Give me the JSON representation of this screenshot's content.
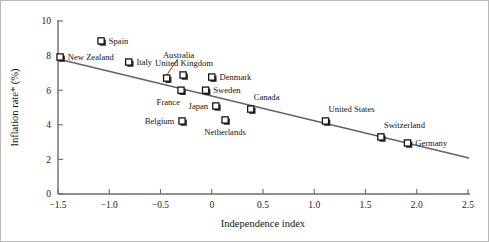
{
  "chart_data": {
    "type": "scatter",
    "title": "",
    "xlabel": "Independence index",
    "ylabel": "Inflation rate* (%)",
    "xlim": [
      -1.5,
      2.5
    ],
    "ylim": [
      0,
      10
    ],
    "grid": false,
    "legend": "none",
    "xticks": [
      "−1.5",
      "−1.0",
      "−0.5",
      "0",
      "0.5",
      "1.0",
      "1.5",
      "2.0",
      "2.5"
    ],
    "xtick_values": [
      -1.5,
      -1.0,
      -0.5,
      0,
      0.5,
      1.0,
      1.5,
      2.0,
      2.5
    ],
    "yticks": [
      "0",
      "2",
      "4",
      "6",
      "8",
      "10"
    ],
    "ytick_values": [
      0,
      2,
      4,
      6,
      8,
      10
    ],
    "points": [
      {
        "label": "New Zealand",
        "x": -1.48,
        "y": 7.92,
        "label_pos": "right"
      },
      {
        "label": "Spain",
        "x": -1.08,
        "y": 8.85,
        "label_pos": "right"
      },
      {
        "label": "Italy",
        "x": -0.81,
        "y": 7.63,
        "label_pos": "right"
      },
      {
        "label": "Australia",
        "x": -0.44,
        "y": 6.7,
        "label_pos": "leader-up"
      },
      {
        "label": "United Kingdom",
        "x": -0.28,
        "y": 6.88,
        "label_pos": "above"
      },
      {
        "label": "France",
        "x": -0.3,
        "y": 6.0,
        "label_pos": "below-left"
      },
      {
        "label": "Denmark",
        "x": 0.0,
        "y": 6.76,
        "label_pos": "right"
      },
      {
        "label": "Sweden",
        "x": -0.06,
        "y": 6.0,
        "label_pos": "right"
      },
      {
        "label": "Belgium",
        "x": -0.29,
        "y": 4.22,
        "label_pos": "left"
      },
      {
        "label": "Japan",
        "x": 0.04,
        "y": 5.09,
        "label_pos": "left"
      },
      {
        "label": "Netherlands",
        "x": 0.13,
        "y": 4.28,
        "label_pos": "below"
      },
      {
        "label": "Canada",
        "x": 0.38,
        "y": 4.91,
        "label_pos": "above-right"
      },
      {
        "label": "United States",
        "x": 1.11,
        "y": 4.22,
        "label_pos": "above-right"
      },
      {
        "label": "Switzerland",
        "x": 1.65,
        "y": 3.3,
        "label_pos": "above-right"
      },
      {
        "label": "Germany",
        "x": 1.91,
        "y": 2.95,
        "label_pos": "right"
      }
    ],
    "trend_line": {
      "x_start": -1.5,
      "y_start": 7.8,
      "x_end": 2.51,
      "y_end": 2.08
    }
  }
}
